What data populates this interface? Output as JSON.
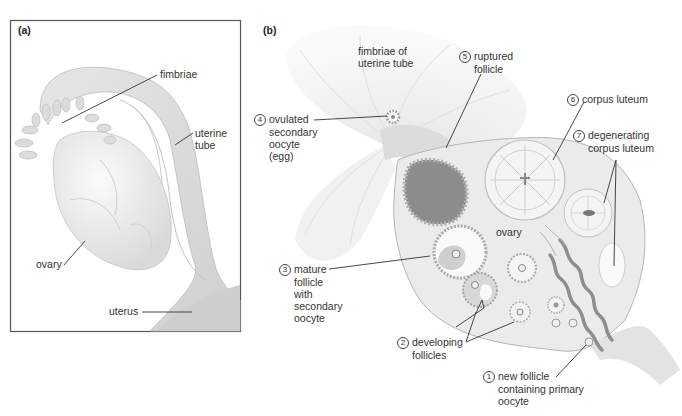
{
  "panels": {
    "a": {
      "tag": "(a)",
      "labels": {
        "fimbriae": "fimbriae",
        "uterine_tube": [
          "uterine",
          "tube"
        ],
        "ovary": "ovary",
        "uterus": "uterus"
      }
    },
    "b": {
      "tag": "(b)",
      "labels": {
        "fimbriae_of_tube": [
          "fimbriae of",
          "uterine tube"
        ],
        "ovary": "ovary",
        "stages": [
          {
            "number": "1",
            "lines": [
              "new follicle",
              "containing primary",
              "oocyte"
            ]
          },
          {
            "number": "2",
            "lines": [
              "developing",
              "follicles"
            ]
          },
          {
            "number": "3",
            "lines": [
              "mature",
              "follicle",
              "with",
              "secondary",
              "oocyte"
            ]
          },
          {
            "number": "4",
            "lines": [
              "ovulated",
              "secondary",
              "oocyte",
              "(egg)"
            ]
          },
          {
            "number": "5",
            "lines": [
              "ruptured",
              "follicle"
            ]
          },
          {
            "number": "6",
            "lines": [
              "corpus luteum"
            ]
          },
          {
            "number": "7",
            "lines": [
              "degenerating",
              "corpus luteum"
            ]
          }
        ]
      }
    }
  },
  "colors": {
    "frame": "#555555",
    "tissue_light": "#ececec",
    "tissue_mid": "#d4d4d4",
    "ruptured_follicle": "#8c8c8c",
    "vessel": "#9a9a9a",
    "leader_line": "#333333"
  }
}
